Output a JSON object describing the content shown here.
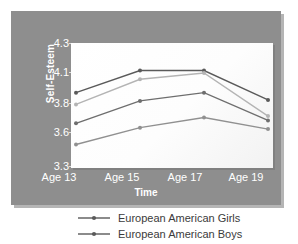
{
  "chart_data": {
    "type": "line",
    "title": "",
    "xlabel": "Time",
    "ylabel": "Self-Esteem",
    "categories": [
      "Age 13",
      "Age 15",
      "Age 17",
      "Age 19"
    ],
    "yticks": [
      3.3,
      3.6,
      3.8,
      4.1,
      4.3
    ],
    "ytick_labels": [
      "3.3",
      "3.6",
      "3.8",
      "4.1",
      "4.3"
    ],
    "ylim": [
      3.3,
      4.3
    ],
    "grid": false,
    "legend_position": "below",
    "series": [
      {
        "name": "series-1",
        "label": "",
        "color": "#5a5a5a",
        "marker": "circle",
        "values": [
          3.9,
          4.11,
          4.11,
          3.83
        ]
      },
      {
        "name": "series-2",
        "label": "",
        "color": "#b4b4b4",
        "marker": "circle",
        "values": [
          3.79,
          4.03,
          4.09,
          3.71
        ]
      },
      {
        "name": "European American Girls",
        "label": "European American Girls",
        "color": "#6e6e6e",
        "marker": "circle",
        "values": [
          3.66,
          3.82,
          3.9,
          3.68
        ]
      },
      {
        "name": "European American Boys",
        "label": "European American Boys",
        "color": "#909090",
        "marker": "circle",
        "values": [
          3.49,
          3.63,
          3.7,
          3.62
        ]
      }
    ]
  },
  "axes": {
    "y_title": "Self-Esteem",
    "x_title": "Time",
    "y_tick_0": "4.3",
    "y_tick_1": "4.1",
    "y_tick_2": "3.8",
    "y_tick_3": "3.6",
    "y_tick_4": "3.3",
    "x_tick_0": "Age 13",
    "x_tick_1": "Age 15",
    "x_tick_2": "Age 17",
    "x_tick_3": "Age 19"
  },
  "legend": {
    "items": [
      {
        "label": "European American Girls",
        "color": "#6e6e6e"
      },
      {
        "label": "European American Boys",
        "color": "#6e6e6e"
      }
    ]
  },
  "colors": {
    "panel_bg": "#8e8e8e",
    "plot_bg": "#ffffff",
    "tick_text": "#ffffff",
    "legend_text": "#3b3b3b"
  }
}
